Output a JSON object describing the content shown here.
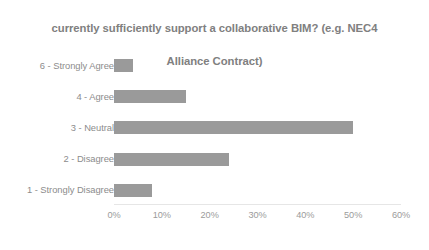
{
  "chart_data": {
    "type": "bar",
    "orientation": "horizontal",
    "title": "currently sufficiently support a collaborative BIM? (e.g. NEC4\nAlliance Contract)",
    "title_line_1": "currently sufficiently support a collaborative BIM? (e.g. NEC4",
    "title_line_2": "Alliance Contract)",
    "xlabel": "",
    "ylabel": "",
    "categories": [
      "6 - Strongly Agree",
      "4 - Agree",
      "3 - Neutral",
      "2 - Disagree",
      "1 - Strongly  Disagree"
    ],
    "values": [
      4,
      15,
      50,
      24,
      8
    ],
    "value_unit": "%",
    "xlim": [
      0,
      60
    ],
    "xticks": [
      0,
      10,
      20,
      30,
      40,
      50,
      60
    ],
    "xtick_labels": [
      "0%",
      "10%",
      "20%",
      "30%",
      "40%",
      "50%",
      "60%"
    ],
    "grid": false,
    "legend": false,
    "bar_color": "#9a9a9a",
    "title_color": "#808080",
    "label_color": "#8c8c8c",
    "tick_color": "#9b9b9b",
    "background": "#ffffff"
  }
}
